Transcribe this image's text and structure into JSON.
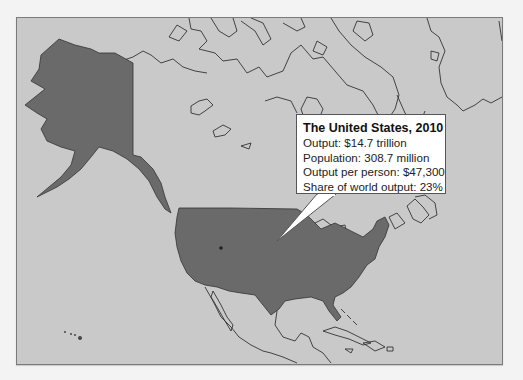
{
  "map": {
    "region": "North America",
    "highlighted_country": "United States",
    "colors": {
      "page_background": "#f3f3f3",
      "land_and_sea": "#c9c9c9",
      "highlight_fill": "#6a6a6a",
      "coastline": "#333333",
      "callout_background": "#ffffff"
    }
  },
  "callout": {
    "title": "The United States, 2010",
    "lines": [
      "Output: $14.7 trillion",
      "Population: 308.7 million",
      "Output per person: $47,300",
      "Share of world output: 23%"
    ]
  }
}
